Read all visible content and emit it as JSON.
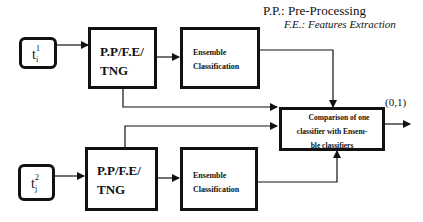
{
  "legend": {
    "pp": "P.P.: Pre-Processing",
    "fe": "F.E.: Features Extraction"
  },
  "inputs": [
    {
      "base": "t",
      "sup": "1",
      "sub": "i"
    },
    {
      "base": "t",
      "sup": "2",
      "sub": "j"
    }
  ],
  "preprocess": {
    "line1": "P.P/F.E/",
    "line2": "TNG"
  },
  "ensemble": {
    "line1": "Ensemble",
    "line2": "Classification"
  },
  "comparison": {
    "line1": "Comparison of one",
    "line2": "classifier with Ensem-",
    "line3": "ble classifiers"
  },
  "output_label": "(0,1)"
}
